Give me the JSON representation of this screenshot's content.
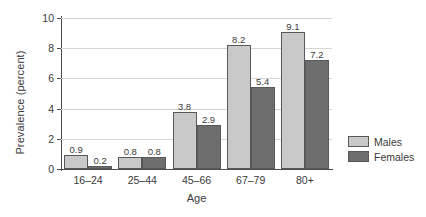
{
  "chart_data": {
    "type": "bar",
    "title": "",
    "xlabel": "Age",
    "ylabel": "Prevalence (percent)",
    "categories": [
      "16–24",
      "25–44",
      "45–66",
      "67–79",
      "80+"
    ],
    "series": [
      {
        "name": "Males",
        "values": [
          0.9,
          0.8,
          3.8,
          8.2,
          9.1
        ],
        "color": "#c9c9c9"
      },
      {
        "name": "Females",
        "values": [
          0.2,
          0.8,
          2.9,
          5.4,
          7.2
        ],
        "color": "#6e6e6e"
      }
    ],
    "ylim": [
      0,
      10
    ],
    "yticks": [
      0,
      2,
      4,
      6,
      8,
      10
    ],
    "ytick_labels": [
      "0",
      "2",
      "4",
      "6",
      "8",
      "10"
    ],
    "grid": true,
    "legend_position": "right",
    "value_labels": true
  },
  "axes": {
    "y_title": "Prevalence (percent)",
    "x_title": "Age"
  },
  "legend": {
    "entries": [
      {
        "label": "Males"
      },
      {
        "label": "Females"
      }
    ]
  }
}
